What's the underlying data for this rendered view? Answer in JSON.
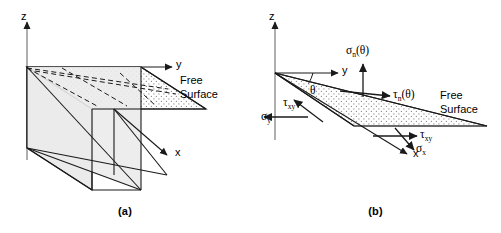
{
  "figure": {
    "background_color": "#ffffff",
    "line_color": "#1a1a1a",
    "fill_color": "#e8e8e8",
    "panels": [
      {
        "id": "a",
        "caption": "(a)",
        "axes": [
          {
            "name": "z",
            "label": "z",
            "direction": "up"
          },
          {
            "name": "y",
            "label": "y",
            "direction": "right"
          },
          {
            "name": "x",
            "label": "x",
            "direction": "down-right"
          }
        ],
        "annotations": [
          {
            "name": "free-surface",
            "line1": "Free",
            "line2": "Surface"
          }
        ]
      },
      {
        "id": "b",
        "caption": "(b)",
        "axes": [
          {
            "name": "z",
            "label": "z",
            "direction": "up"
          },
          {
            "name": "y",
            "label": "y",
            "direction": "right"
          },
          {
            "name": "x",
            "label": "x",
            "direction": "down-right"
          }
        ],
        "angle": {
          "name": "theta",
          "label": "θ"
        },
        "stresses": [
          {
            "name": "sigma-n-theta",
            "symbol": "σ",
            "subscript": "n",
            "argument": "(θ)",
            "full": "σn(θ)",
            "direction": "normal-to-inclined-face"
          },
          {
            "name": "tau-n-theta",
            "symbol": "τ",
            "subscript": "n",
            "argument": "(θ)",
            "full": "τn(θ)",
            "direction": "tangent-to-inclined-face"
          },
          {
            "name": "tau-xy-upper",
            "symbol": "τ",
            "subscript": "xy",
            "argument": "",
            "full": "τxy",
            "direction": "up-left"
          },
          {
            "name": "sigma-y",
            "symbol": "σ",
            "subscript": "y",
            "argument": "",
            "full": "σy",
            "direction": "left"
          },
          {
            "name": "tau-xy-lower",
            "symbol": "τ",
            "subscript": "xy",
            "argument": "",
            "full": "τxy",
            "direction": "right"
          },
          {
            "name": "sigma-x",
            "symbol": "σ",
            "subscript": "x",
            "argument": "",
            "full": "σx",
            "direction": "down-right"
          }
        ],
        "annotations": [
          {
            "name": "free-surface",
            "line1": "Free",
            "line2": "Surface"
          }
        ]
      }
    ]
  }
}
